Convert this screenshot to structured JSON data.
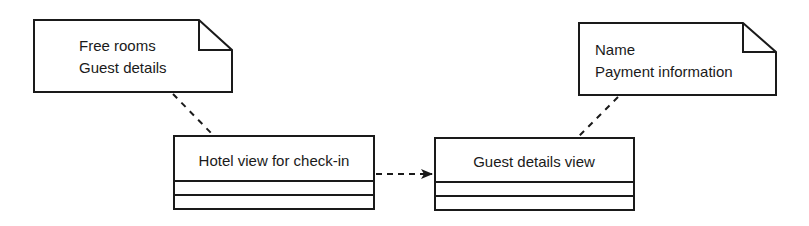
{
  "diagram": {
    "type": "UML class diagram with notes",
    "notes": [
      {
        "id": "note-hotel",
        "lines": [
          "Free rooms",
          "Guest details"
        ]
      },
      {
        "id": "note-guest",
        "lines": [
          "Name",
          "Payment information"
        ]
      }
    ],
    "classes": [
      {
        "id": "hotel-view",
        "name": "Hotel view for check-in",
        "compartments": 2
      },
      {
        "id": "guest-view",
        "name": "Guest details view",
        "compartments": 2
      }
    ],
    "connectors": [
      {
        "from": "note-hotel",
        "to": "hotel-view",
        "style": "dashed",
        "arrow": "none"
      },
      {
        "from": "note-guest",
        "to": "guest-view",
        "style": "dashed",
        "arrow": "none"
      },
      {
        "from": "hotel-view",
        "to": "guest-view",
        "style": "dashed",
        "arrow": "filled"
      }
    ],
    "colors": {
      "stroke": "#1a1a1a",
      "fill": "#ffffff"
    }
  }
}
